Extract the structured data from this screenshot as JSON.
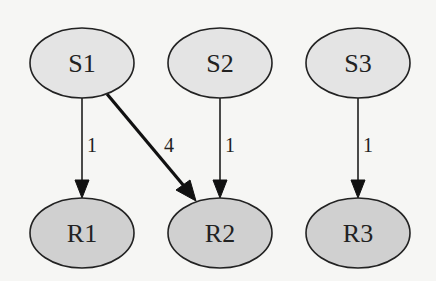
{
  "diagram": {
    "type": "directed-graph",
    "colors": {
      "background": "#f6f6f4",
      "source_fill": "#e4e4e4",
      "target_fill": "#d0d0d0",
      "stroke": "#222222"
    },
    "nodes": [
      {
        "id": "S1",
        "label": "S1",
        "group": "source",
        "cx": 82,
        "cy": 63
      },
      {
        "id": "S2",
        "label": "S2",
        "group": "source",
        "cx": 220,
        "cy": 63
      },
      {
        "id": "S3",
        "label": "S3",
        "group": "source",
        "cx": 358,
        "cy": 63
      },
      {
        "id": "R1",
        "label": "R1",
        "group": "target",
        "cx": 82,
        "cy": 232
      },
      {
        "id": "R2",
        "label": "R2",
        "group": "target",
        "cx": 220,
        "cy": 232
      },
      {
        "id": "R3",
        "label": "R3",
        "group": "target",
        "cx": 358,
        "cy": 232
      }
    ],
    "edges": [
      {
        "from": "S1",
        "to": "R1",
        "label": "1",
        "weight": 1
      },
      {
        "from": "S1",
        "to": "R2",
        "label": "4",
        "weight": 4
      },
      {
        "from": "S2",
        "to": "R2",
        "label": "1",
        "weight": 1
      },
      {
        "from": "S3",
        "to": "R3",
        "label": "1",
        "weight": 1
      }
    ]
  }
}
